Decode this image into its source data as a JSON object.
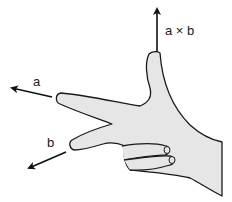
{
  "diagram": {
    "labels": {
      "a": "a",
      "b": "b",
      "cross": "a × b"
    },
    "colors": {
      "hand_fill": "#e6e6e6",
      "outline": "#1a1a1a",
      "arrow": "#111111",
      "background": "#ffffff"
    }
  }
}
